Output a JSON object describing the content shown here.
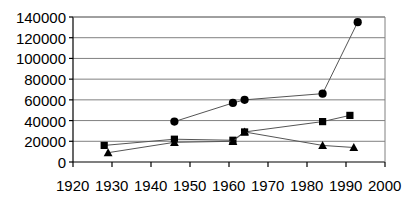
{
  "chart_data": {
    "type": "line",
    "title": "",
    "subtitle": "",
    "xlabel": "",
    "ylabel": "",
    "xlim": [
      1920,
      2000
    ],
    "ylim": [
      0,
      140000
    ],
    "xticks": [
      1920,
      1930,
      1940,
      1950,
      1960,
      1970,
      1980,
      1990,
      2000
    ],
    "yticks": [
      0,
      20000,
      40000,
      60000,
      80000,
      100000,
      120000,
      140000
    ],
    "xtick_labels": [
      "1920",
      "1930",
      "1940",
      "1950",
      "1960",
      "1970",
      "1980",
      "1990",
      "2000"
    ],
    "ytick_labels": [
      "0",
      "20000",
      "40000",
      "60000",
      "80000",
      "100000",
      "120000",
      "140000"
    ],
    "grid": "horizontal",
    "legend": "none",
    "series": [
      {
        "name": "series-circle",
        "marker": "circle",
        "color": "#000000",
        "points": [
          {
            "x": 1946,
            "y": 39000
          },
          {
            "x": 1961,
            "y": 57000
          },
          {
            "x": 1964,
            "y": 60000
          },
          {
            "x": 1984,
            "y": 66000
          },
          {
            "x": 1993,
            "y": 135000
          }
        ]
      },
      {
        "name": "series-square",
        "marker": "square",
        "color": "#000000",
        "points": [
          {
            "x": 1928,
            "y": 16000
          },
          {
            "x": 1946,
            "y": 22000
          },
          {
            "x": 1961,
            "y": 21000
          },
          {
            "x": 1964,
            "y": 29000
          },
          {
            "x": 1984,
            "y": 39000
          },
          {
            "x": 1991,
            "y": 45000
          }
        ]
      },
      {
        "name": "series-triangle",
        "marker": "triangle",
        "color": "#000000",
        "points": [
          {
            "x": 1929,
            "y": 9000
          },
          {
            "x": 1946,
            "y": 19000
          },
          {
            "x": 1961,
            "y": 20000
          },
          {
            "x": 1964,
            "y": 29000
          },
          {
            "x": 1984,
            "y": 16000
          },
          {
            "x": 1992,
            "y": 14000
          }
        ]
      }
    ],
    "colors": {
      "axis": "#000000",
      "grid": "#808080",
      "marker": "#000000",
      "line": "#555555",
      "background": "#ffffff"
    }
  },
  "geometry": {
    "plot_left": 73,
    "plot_right": 385,
    "plot_top": 17,
    "plot_bottom": 162
  }
}
